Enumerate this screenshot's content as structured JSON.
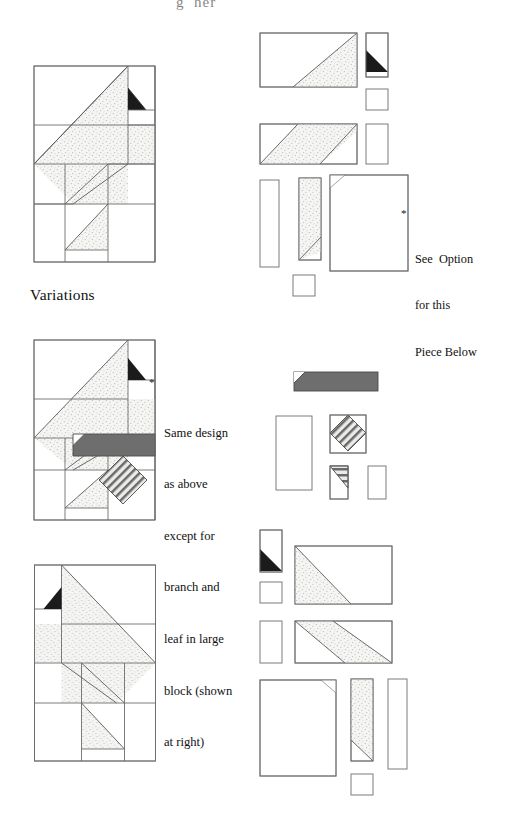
{
  "page": {
    "width": 509,
    "height": 821,
    "background": "#ffffff",
    "cropped_header_text": "g  her"
  },
  "palette": {
    "line": "#6b6b6b",
    "line_dark": "#3a3a3a",
    "stipple_fill": "#f4f4f2",
    "stipple_dot": "#b9b9b4",
    "solid_black": "#1b1b1b",
    "branch_gray": "#6e6e6e",
    "leaf_hatch_bg": "#e8e8e6",
    "leaf_hatch_line": "#5e5e5e",
    "white": "#ffffff",
    "text": "#111111"
  },
  "headings": {
    "variations": "Variations"
  },
  "notes": {
    "option_note": {
      "marker": "*",
      "lines": [
        "See  Option",
        "for this",
        "Piece Below"
      ],
      "text": "* See Option for this Piece Below"
    },
    "variation_note": {
      "marker": "*",
      "lines": [
        "Same design",
        "as above",
        "except for",
        "branch and",
        "leaf in large",
        "block (shown",
        "at right)"
      ],
      "text": "* Same design as above except for branch and leaf in large block (shown at right)"
    }
  },
  "sections": [
    {
      "id": "section-main",
      "name": "main-block-and-pieces",
      "block_label": "Tree block, assembled view",
      "pieces_label": "Cutting pieces for main block"
    },
    {
      "id": "section-variation-1",
      "name": "variation-branch-leaf",
      "block_label": "Variation block with branch and leaf",
      "pieces_label": "Option pieces: branch bar, leaf square, leaf corner, plain rectangles"
    },
    {
      "id": "section-variation-2",
      "name": "variation-mirrored",
      "block_label": "Mirrored tree block",
      "pieces_label": "Cutting pieces for mirrored block"
    }
  ],
  "legend": {
    "stipple": "stippled / textured fabric",
    "solid": "solid dark fabric",
    "branch": "solid gray branch fabric",
    "leaf": "diagonal striped leaf fabric",
    "plain": "background fabric"
  }
}
